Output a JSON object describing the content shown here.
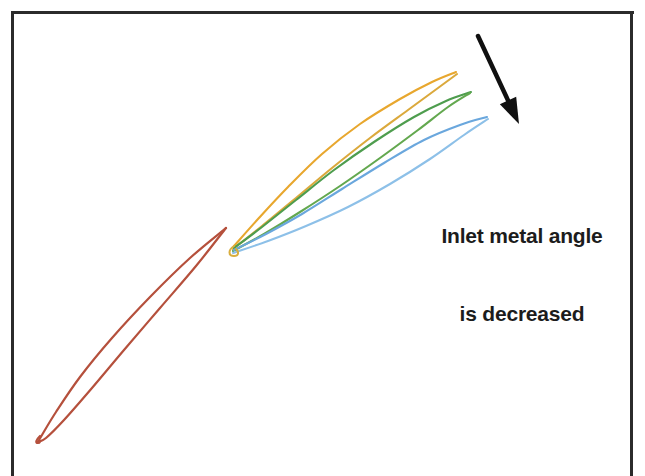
{
  "figure": {
    "domain": "Diagram",
    "title_visible": false,
    "background_color": "#ffffff",
    "width": 645,
    "height": 476,
    "border": {
      "name": "figure-border",
      "color": "#2b2b2b",
      "width_px": 3,
      "left_x": 11,
      "top_y": 11,
      "right_x": 633,
      "bottom_y": 476,
      "bottom_edge_cropped": true
    },
    "annotation": {
      "line1": "Inlet metal angle",
      "line2": "is decreased",
      "color": "#1c1c1c",
      "x": 522,
      "y": 198
    },
    "arrow": {
      "name": "direction-arrow",
      "color": "#101010",
      "tail_x": 478,
      "tail_y": 36,
      "head_x": 519,
      "head_y": 124,
      "meaning": "direction of decreasing inlet metal angle"
    },
    "colors": {
      "reference_blade": "#b5503c",
      "camber_orange": "#e8a72e",
      "camber_gold": "#dba93c",
      "camber_green": "#4e9d4e",
      "camber_green2": "#63a84f",
      "camber_blue": "#6aa7dd",
      "camber_lightblue": "#8dc0e8",
      "arrow": "#101010",
      "border": "#2b2b2b",
      "text": "#1c1c1c"
    },
    "leading_edge_junction": {
      "x": 234,
      "y": 244
    }
  },
  "chart_data": {
    "type": "line",
    "xlabel": "",
    "ylabel": "",
    "xlim": [
      0,
      645
    ],
    "ylim": [
      476,
      0
    ],
    "grid": false,
    "legend": "none",
    "annotations": [
      {
        "text": "Inlet metal angle\nis decreased",
        "x": 522,
        "y": 198
      }
    ],
    "series": [
      {
        "name": "reference-blade-suction-side",
        "color": "#b5503c",
        "role": "reference blade profile upper surface",
        "points": [
          [
            226,
            228
          ],
          [
            190,
            258
          ],
          [
            150,
            297
          ],
          [
            112,
            338
          ],
          [
            80,
            377
          ],
          [
            56,
            412
          ],
          [
            42,
            435
          ],
          [
            38,
            442
          ]
        ]
      },
      {
        "name": "reference-blade-pressure-side",
        "color": "#b5503c",
        "role": "reference blade profile lower surface",
        "points": [
          [
            226,
            228
          ],
          [
            196,
            266
          ],
          [
            160,
            308
          ],
          [
            124,
            350
          ],
          [
            92,
            388
          ],
          [
            64,
            420
          ],
          [
            46,
            438
          ],
          [
            38,
            442
          ]
        ]
      },
      {
        "name": "camber-orange-1",
        "color": "#e8a72e",
        "role": "camber line, largest inlet metal angle",
        "points": [
          [
            234,
            246
          ],
          [
            258,
            219
          ],
          [
            288,
            187
          ],
          [
            322,
            154
          ],
          [
            360,
            124
          ],
          [
            400,
            99
          ],
          [
            432,
            82
          ],
          [
            456,
            72
          ]
        ]
      },
      {
        "name": "camber-orange-2",
        "color": "#dba93c",
        "role": "camber line, orange variant",
        "points": [
          [
            233,
            249
          ],
          [
            262,
            226
          ],
          [
            296,
            198
          ],
          [
            332,
            168
          ],
          [
            370,
            138
          ],
          [
            408,
            110
          ],
          [
            438,
            88
          ],
          [
            457,
            74
          ]
        ]
      },
      {
        "name": "camber-green-1",
        "color": "#4e9d4e",
        "role": "camber line, intermediate inlet metal angle",
        "points": [
          [
            234,
            248
          ],
          [
            262,
            227
          ],
          [
            296,
            200
          ],
          [
            334,
            170
          ],
          [
            374,
            142
          ],
          [
            414,
            117
          ],
          [
            446,
            101
          ],
          [
            471,
            92
          ]
        ]
      },
      {
        "name": "camber-green-2",
        "color": "#63a84f",
        "role": "camber line, green variant",
        "points": [
          [
            233,
            251
          ],
          [
            264,
            234
          ],
          [
            300,
            212
          ],
          [
            340,
            186
          ],
          [
            380,
            158
          ],
          [
            418,
            130
          ],
          [
            448,
            107
          ],
          [
            470,
            93
          ]
        ]
      },
      {
        "name": "camber-blue-1",
        "color": "#6aa7dd",
        "role": "camber line, smallest inlet metal angle",
        "points": [
          [
            234,
            250
          ],
          [
            266,
            234
          ],
          [
            302,
            214
          ],
          [
            342,
            189
          ],
          [
            384,
            163
          ],
          [
            424,
            140
          ],
          [
            460,
            125
          ],
          [
            487,
            117
          ]
        ]
      },
      {
        "name": "camber-blue-2",
        "color": "#8dc0e8",
        "role": "camber line, light blue variant",
        "points": [
          [
            233,
            253
          ],
          [
            268,
            241
          ],
          [
            306,
            226
          ],
          [
            348,
            207
          ],
          [
            390,
            184
          ],
          [
            430,
            159
          ],
          [
            464,
            135
          ],
          [
            488,
            119
          ]
        ]
      }
    ]
  }
}
